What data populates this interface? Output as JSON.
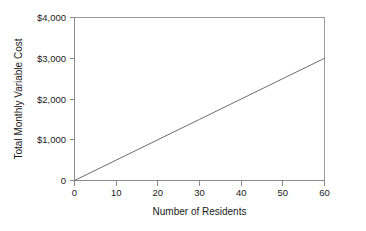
{
  "chart_data": {
    "type": "line",
    "title": "",
    "subtitle": "",
    "xlabel": "Number of Residents",
    "ylabel": "Total Monthly Variable Cost",
    "xlim": [
      0,
      60
    ],
    "ylim": [
      0,
      4000
    ],
    "grid": false,
    "legend": null,
    "x_ticks": [
      0,
      10,
      20,
      30,
      40,
      50,
      60
    ],
    "x_tick_labels": [
      "0",
      "10",
      "20",
      "30",
      "40",
      "50",
      "60"
    ],
    "y_ticks": [
      0,
      1000,
      2000,
      3000,
      4000
    ],
    "y_tick_labels": [
      "0",
      "$1,000",
      "$2,000",
      "$3,000",
      "$4,000"
    ],
    "series": [
      {
        "name": "Total Monthly Variable Cost",
        "color": "#6e6e6e",
        "slope_per_resident": 50,
        "x": [
          0,
          10,
          20,
          30,
          40,
          50,
          60
        ],
        "values": [
          0,
          500,
          1000,
          1500,
          2000,
          2500,
          3000
        ]
      }
    ],
    "annotations": []
  },
  "axes": {
    "y_title": "Total Monthly Variable Cost",
    "x_title": "Number of Residents",
    "y_labels": {
      "t0": "0",
      "t1": "$1,000",
      "t2": "$2,000",
      "t3": "$3,000",
      "t4": "$4,000"
    },
    "x_labels": {
      "t0": "0",
      "t1": "10",
      "t2": "20",
      "t3": "30",
      "t4": "40",
      "t5": "50",
      "t6": "60"
    }
  },
  "colors": {
    "line": "#6e6e6e",
    "axis": "#8a8a8a",
    "frame": "#9a9a9a",
    "text": "#1a1a1a",
    "background": "#ffffff"
  }
}
